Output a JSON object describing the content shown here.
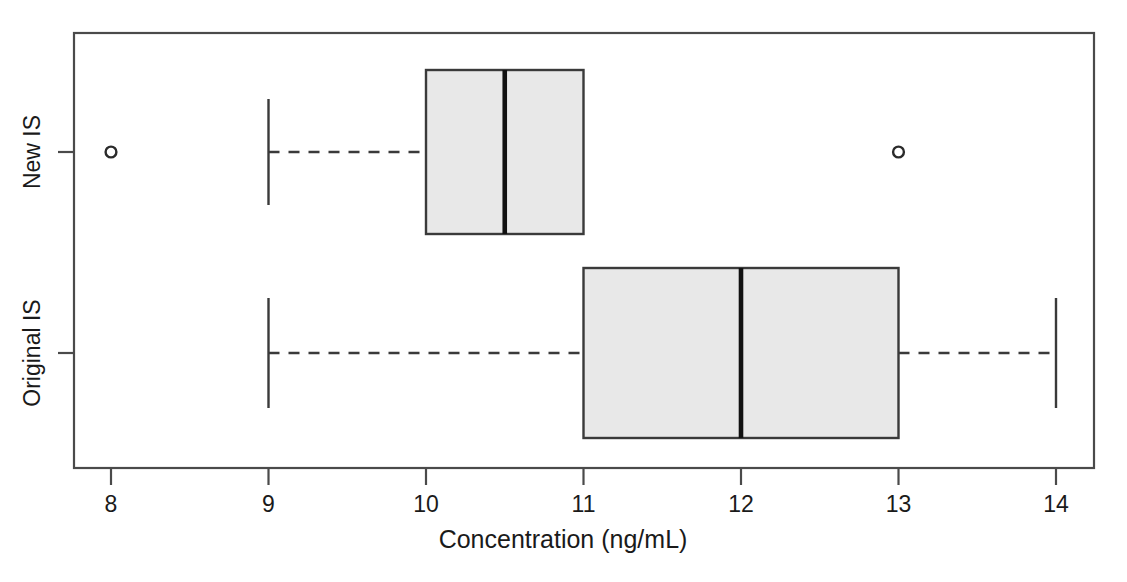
{
  "chart_data": {
    "type": "box",
    "title": "",
    "subtitle": "",
    "xlabel": "Concentration (ng/mL)",
    "ylabel": "",
    "orientation": "horizontal",
    "grid": false,
    "legend": "none",
    "xlim": [
      7.76,
      14.24
    ],
    "xticks": [
      8,
      9,
      10,
      11,
      12,
      13,
      14
    ],
    "xtick_labels": [
      "8",
      "9",
      "10",
      "11",
      "12",
      "13",
      "14"
    ],
    "categories": [
      "New IS",
      "Original IS"
    ],
    "boxes": [
      {
        "name": "New IS",
        "whisker_low": 9,
        "q1": 10,
        "median": 10.5,
        "q3": 11,
        "whisker_high": 11,
        "show_low_cap": true,
        "show_high_cap": false,
        "outliers": [
          8,
          13
        ]
      },
      {
        "name": "Original IS",
        "whisker_low": 9,
        "q1": 11,
        "median": 12,
        "q3": 13,
        "whisker_high": 14,
        "show_low_cap": true,
        "show_high_cap": true,
        "outliers": []
      }
    ],
    "colors": {
      "box_fill": "#e8e8e8",
      "box_stroke": "#3a3a3a",
      "median_stroke": "#111111",
      "whisker_stroke": "#3a3a3a",
      "outlier_stroke": "#2b2b2b",
      "axis_stroke": "#4a4a4a",
      "background": "#ffffff",
      "text": "#1a1a1a"
    }
  }
}
